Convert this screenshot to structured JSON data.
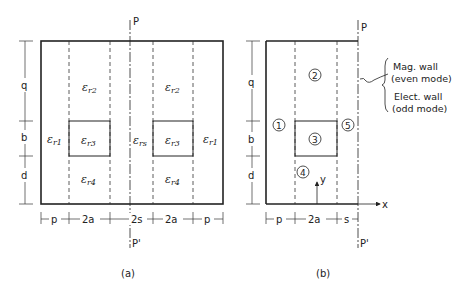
{
  "figure_a": {
    "caption": "(a)",
    "symmetry_top": "P",
    "symmetry_bottom": "P'",
    "regions": {
      "r1_left": {
        "eps": "ε",
        "sub": "r1"
      },
      "r2_left": {
        "eps": "ε",
        "sub": "r2"
      },
      "r3_left": {
        "eps": "ε",
        "sub": "r3"
      },
      "r4_left": {
        "eps": "ε",
        "sub": "r4"
      },
      "rs": {
        "eps": "ε",
        "sub": "rs"
      },
      "r2_right": {
        "eps": "ε",
        "sub": "r2"
      },
      "r3_right": {
        "eps": "ε",
        "sub": "r3"
      },
      "r4_right": {
        "eps": "ε",
        "sub": "r4"
      },
      "r1_right": {
        "eps": "ε",
        "sub": "r1"
      }
    },
    "vertical_dims": [
      "q",
      "b",
      "d"
    ],
    "horizontal_dims": [
      "p",
      "2a",
      "2s",
      "2a",
      "p"
    ]
  },
  "figure_b": {
    "caption": "(b)",
    "symmetry_top": "P",
    "symmetry_bottom": "P'",
    "regions": [
      "1",
      "2",
      "3",
      "4",
      "5"
    ],
    "vertical_dims": [
      "q",
      "b",
      "d"
    ],
    "horizontal_dims": [
      "p",
      "2a",
      "s"
    ],
    "axis_x": "x",
    "axis_y": "y",
    "wall_labels": {
      "mag_line1": "Mag. wall",
      "mag_line2": "(even mode)",
      "elec_line1": "Elect. wall",
      "elec_line2": "(odd mode)"
    }
  }
}
